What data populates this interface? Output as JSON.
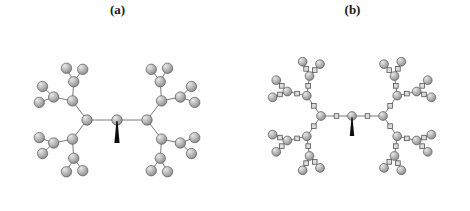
{
  "figure": {
    "background_color": "#fefefe",
    "width": 470,
    "height": 211,
    "panels": [
      {
        "id": "a",
        "label": "(a)",
        "node_type": "sphere",
        "has_linker_squares": false,
        "description": "Dendrimer with spherical monomer units only",
        "core_marker": "black-wedge"
      },
      {
        "id": "b",
        "label": "(b)",
        "node_type": "sphere-and-square",
        "has_linker_squares": true,
        "description": "Dendrimer with spherical monomer units joined by square linker units",
        "core_marker": "black-wedge"
      }
    ]
  },
  "style": {
    "sphere_fill_light": "#e8e8e8",
    "sphere_fill_mid": "#bfbfbf",
    "sphere_fill_dark": "#8a8a8a",
    "sphere_stroke": "#5a5a5a",
    "square_fill": "#dcdcdc",
    "square_stroke": "#4a4a4a",
    "bond_color": "#6b6b6b",
    "wedge_color": "#0d0d0d",
    "label_color": "#1a1a1a"
  },
  "chart_data": {
    "type": "diagram",
    "title": "",
    "panels": [
      {
        "name": "(a)",
        "generations": 4,
        "core_degree": 2,
        "branch_multiplicity": 2,
        "node_count": 62,
        "node_shape": "sphere",
        "sphere_radius_px": 5.2
      },
      {
        "name": "(b)",
        "generations": 4,
        "core_degree": 2,
        "branch_multiplicity": 2,
        "node_count": 62,
        "linker_count": 61,
        "node_shape": "sphere",
        "linker_shape": "square",
        "sphere_radius_px": 4.4,
        "square_size_px": 4.6
      }
    ]
  }
}
